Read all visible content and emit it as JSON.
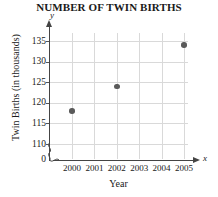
{
  "chart_data": {
    "type": "scatter",
    "title": "NUMBER OF TWIN BIRTHS",
    "xlabel": "Year",
    "ylabel": "Twin Births (in thousands)",
    "x_axis_variable": "x",
    "y_axis_variable": "y",
    "xlim": [
      2000,
      2005
    ],
    "ylim": [
      110,
      135
    ],
    "y_axis_break": true,
    "y_origin_label": "0",
    "grid": true,
    "legend": null,
    "x_tick_labels": [
      "2000",
      "2001",
      "2002",
      "2003",
      "2004",
      "2005"
    ],
    "x_ticks": [
      2000,
      2001,
      2002,
      2003,
      2004,
      2005
    ],
    "y_tick_labels": [
      "110",
      "115",
      "120",
      "125",
      "130",
      "135"
    ],
    "y_ticks": [
      110,
      115,
      120,
      125,
      130,
      135
    ],
    "x": [
      2000,
      2002,
      2005
    ],
    "values": [
      118,
      124,
      134
    ],
    "points": [
      {
        "x": 2000,
        "y": 118
      },
      {
        "x": 2002,
        "y": 124
      },
      {
        "x": 2005,
        "y": 134
      }
    ],
    "marker_color": "#5a5a5a",
    "grid_color": "#d9d9d9",
    "axis_color": "#444444"
  }
}
